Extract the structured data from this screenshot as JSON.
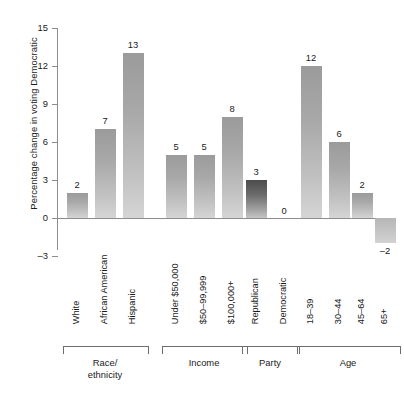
{
  "chart_data": {
    "type": "bar",
    "title": "",
    "xlabel": "",
    "ylabel": "Percentage change in voting Democratic",
    "ylim": [
      -3,
      15
    ],
    "yticks": [
      -3,
      0,
      3,
      6,
      9,
      12,
      15
    ],
    "ytick_labels": [
      "–3",
      "0",
      "3",
      "6",
      "9",
      "12",
      "15"
    ],
    "grid": false,
    "legend": null,
    "categories": [
      "White",
      "African American",
      "Hispanic",
      "Under $50,000",
      "$50–99,999",
      "$100,000+",
      "Republican",
      "Democratic",
      "18–39",
      "30–44",
      "45–64",
      "65+"
    ],
    "values": [
      2,
      7,
      13,
      5,
      5,
      8,
      3,
      0,
      12,
      6,
      2,
      -2
    ],
    "value_labels": [
      "2",
      "7",
      "13",
      "5",
      "5",
      "8",
      "3",
      "0",
      "12",
      "6",
      "2",
      "–2"
    ],
    "groups": [
      {
        "label": "Race/\nethnicity",
        "label_line1": "Race/",
        "label_line2": "ethnicity",
        "members": [
          0,
          1,
          2
        ]
      },
      {
        "label": "Income",
        "label_line1": "Income",
        "label_line2": "",
        "members": [
          3,
          4,
          5
        ]
      },
      {
        "label": "Party",
        "label_line1": "Party",
        "label_line2": "",
        "members": [
          6,
          7
        ]
      },
      {
        "label": "Age",
        "label_line1": "Age",
        "label_line2": "",
        "members": [
          8,
          9,
          10,
          11
        ]
      }
    ],
    "bar_styles": [
      "light",
      "light",
      "light",
      "light",
      "light",
      "light",
      "dark",
      "zero",
      "light",
      "light",
      "light",
      "neg"
    ],
    "colors": {
      "bar_light_top": "#9b9b9b",
      "bar_light_bottom": "#d5d5d5",
      "bar_dark_top": "#4c4c4c",
      "bar_dark_bottom": "#c6c6c6",
      "axis": "#8d8d8d",
      "text": "#1a1a1a",
      "background": "#ffffff"
    }
  }
}
